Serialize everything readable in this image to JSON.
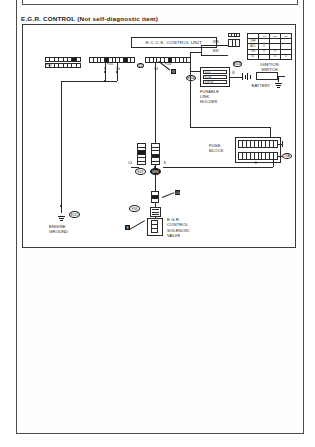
{
  "page": {
    "previous_section_label": "E.G.R. SYSTEM (Not self-diagnostic item)"
  },
  "section": {
    "title": "E.G.R. CONTROL  (Not self-diagnostic item)"
  },
  "components": {
    "eccs_control_unit": {
      "label": "E.C.C.S. CONTROL UNIT",
      "connector_tag_left": "F102",
      "connector_tag_mid": "F101",
      "connector_tag_right": "F103",
      "pin_tag": "11"
    },
    "ignition_switch": {
      "label": "IGNITION\nSWITCH",
      "connector_tag": "E105",
      "table": {
        "header": [
          "",
          "ACC",
          "ON",
          "ST"
        ],
        "rows": [
          [
            "OFF",
            "",
            "",
            ""
          ],
          [
            "ACC",
            "O",
            "",
            ""
          ],
          [
            "ON",
            "O",
            "O",
            ""
          ],
          [
            "ST",
            "",
            "O",
            "O"
          ]
        ]
      }
    },
    "fusible_link_holder": {
      "label": "FUSABLE\nLINK\nHOLDER",
      "connector_tag": "E104",
      "links": [
        "0.5 L",
        "0.5 B",
        "0.85 W"
      ]
    },
    "battery": {
      "label": "BATTERY"
    },
    "fuse_block": {
      "label": "FUSE\nBLOCK",
      "connector_tag": "15A"
    },
    "harness_junction": {
      "left_tag": "E19",
      "right_tag": "M84"
    },
    "egr_control_solenoid_valve": {
      "label": "E.G.R.\nCONTROL\nSOLENOID\nVALVE",
      "connector_tag": "F26",
      "wire_marker_top": "LG",
      "wire_marker_bottom": "B"
    },
    "engine_ground": {
      "label": "ENGINE\nGROUND",
      "connector_tag": "E115"
    }
  },
  "wire_markers": {
    "eccs_left_out": "B",
    "eccs_mid_out": "LG",
    "eccs_right_out": "LG",
    "eccs_right_color": "W",
    "ign_to_switch": "W/B",
    "ign_feed": "B/W",
    "flh_out": "W",
    "fuse_out": "B",
    "junction_left": "LG",
    "junction_right": "B"
  },
  "colors": {
    "ink": "#1a1a1a",
    "line": "#2a2a2a",
    "frame": "#3c3c3c",
    "paper": "#ffffff"
  }
}
